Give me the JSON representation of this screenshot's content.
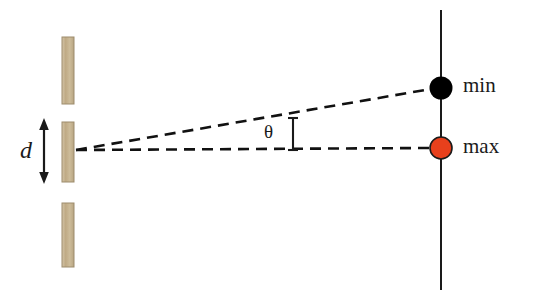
{
  "figure": {
    "kind": "double-slit-interference-diagram",
    "width": 544,
    "height": 299,
    "background_color": "#ffffff"
  },
  "labels": {
    "min": "min",
    "max": "max",
    "slit_separation": "d",
    "angle": "θ"
  },
  "colors": {
    "background": "#ffffff",
    "barrier_bar_fill": "#c9b491",
    "barrier_bar_edge": "#a08f70",
    "min_dot": "#000000",
    "max_dot": "#e8401c",
    "max_dot_edge": "#1a1a1a",
    "screen_line": "#1a1a1a",
    "ray_dashed": "#111111",
    "text": "#1a1a1a"
  },
  "elements": {
    "barrier_bars": [
      {
        "name": "barrier-bar-top",
        "x": 62,
        "y": 37,
        "width": 12,
        "height": 67
      },
      {
        "name": "barrier-bar-middle",
        "x": 62,
        "y": 122,
        "width": 12,
        "height": 60
      },
      {
        "name": "barrier-bar-bottom",
        "x": 62,
        "y": 203,
        "width": 12,
        "height": 64
      }
    ],
    "slit_source": {
      "x": 76,
      "y": 150
    },
    "screen_line": {
      "x": 441,
      "y_top": 10,
      "y_bottom": 290
    },
    "dots": [
      {
        "name": "min-dot",
        "label": "min",
        "cx": 441,
        "cy": 88,
        "r": 11,
        "fill": "#000000"
      },
      {
        "name": "max-dot",
        "label": "max",
        "cx": 441,
        "cy": 148,
        "r": 11,
        "fill": "#e8401c"
      }
    ],
    "rays": [
      {
        "name": "ray-to-min",
        "x1": 76,
        "y1": 150,
        "x2": 432,
        "y2": 89
      },
      {
        "name": "ray-to-max",
        "x1": 76,
        "y1": 150,
        "x2": 430,
        "y2": 148
      }
    ],
    "angle_caliper": {
      "x": 293,
      "y_top": 118,
      "y_bottom": 150,
      "tick_half_width": 5
    },
    "separation_arrow": {
      "x": 44,
      "y_top": 120,
      "y_bottom": 182
    }
  }
}
